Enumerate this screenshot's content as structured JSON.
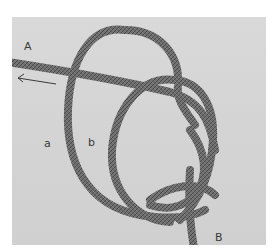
{
  "figure": {
    "labels": {
      "end_a_upper": "A",
      "loop_a": "a",
      "loop_b": "b",
      "end_b_upper": "B"
    },
    "arrow_direction": "left",
    "colors": {
      "frame": "#ffffff",
      "background": "#d5d5d5",
      "rope": "#6e6e6e",
      "rope_dark": "#4a4a4a",
      "label": "#3a3a3a"
    }
  }
}
